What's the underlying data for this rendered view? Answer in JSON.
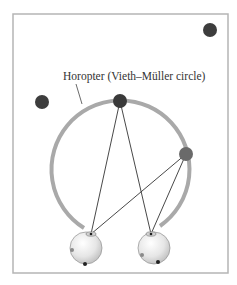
{
  "figure": {
    "label": "Horopter (Vieth–Müller circle)",
    "frame": {
      "x": 13,
      "y": 14,
      "w": 215,
      "h": 259,
      "stroke": "#b5b5b5"
    },
    "circle": {
      "cx": 121,
      "cy": 170,
      "r": 69,
      "stroke": "#a9a9a9"
    },
    "points": [
      {
        "name": "far-point-top-right",
        "x": 210,
        "y": 30,
        "r": 7,
        "fill": "#3d3d3d"
      },
      {
        "name": "near-point-left",
        "x": 42,
        "y": 102,
        "r": 7,
        "fill": "#3d3d3d"
      },
      {
        "name": "fixation-point-top",
        "x": 120,
        "y": 101,
        "r": 7,
        "fill": "#3a3a3a"
      },
      {
        "name": "horopter-point-right",
        "x": 186,
        "y": 154,
        "r": 7,
        "fill": "#6a6a6a"
      }
    ],
    "eyes": [
      {
        "name": "left-eye",
        "cx": 86,
        "cy": 248,
        "r": 16,
        "nodal": {
          "x": 91,
          "y": 234
        }
      },
      {
        "name": "right-eye",
        "cx": 154,
        "cy": 248,
        "r": 16,
        "nodal": {
          "x": 151,
          "y": 234
        }
      }
    ],
    "colors": {
      "ray": "#333333",
      "retina_dot_dark": "#222222",
      "retina_dot_grey": "#8a8a8a"
    }
  }
}
